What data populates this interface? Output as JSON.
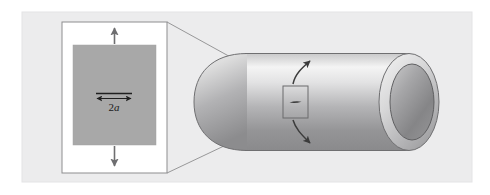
{
  "figure": {
    "background_color": "#ffffff",
    "panel_color": "#ececed",
    "panel_border_color": "#e2e2e3"
  },
  "inset": {
    "name": "crack-detail-inset",
    "frame_color": "#ffffff",
    "frame_border_color": "#8d8d8f",
    "plate_color": "#a8a8a8",
    "plate_border_color": "#a0a0a0",
    "dimension_label": "2a",
    "dimension_label_prefix": "2",
    "dimension_label_symbol": "a",
    "load_arrow_color": "#6e6e70",
    "load_direction_top": "up",
    "load_direction_bottom": "down",
    "crack_width_label": "2a"
  },
  "cylinder": {
    "name": "pressure-vessel-cylinder",
    "body_highlight_color": "#f2f2f2",
    "body_shadow_color": "#8f8f91",
    "outline_color": "#6b6b6d",
    "bore_rim_color": "#cfcfd0",
    "bore_inner_color": "#8c8c8e",
    "flaw_square_border_color": "#6b6b6d",
    "crack_color": "#3a3a3a",
    "stress_arrow_color": "#3c3c3c",
    "stress_arrow_top_direction": "up-right",
    "stress_arrow_bottom_direction": "down-right"
  },
  "connectors": {
    "name": "magnifier-leader-lines",
    "color": "#8d8d8f",
    "count": 2
  }
}
